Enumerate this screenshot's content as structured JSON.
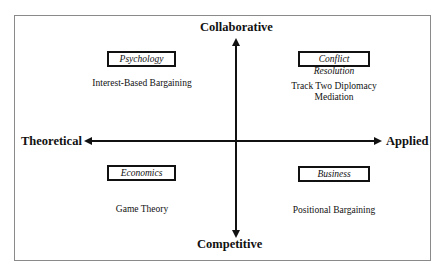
{
  "axes": {
    "top": "Collaborative",
    "bottom": "Competitive",
    "left": "Theoretical",
    "right": "Applied"
  },
  "quadrants": [
    {
      "position": "top-left",
      "discipline": "Psychology",
      "approaches": [
        "Interest-Based Bargaining"
      ]
    },
    {
      "position": "top-right",
      "discipline": "Conflict Resolution",
      "approaches": [
        "Track Two Diplomacy",
        "Mediation"
      ]
    },
    {
      "position": "bottom-left",
      "discipline": "Economics",
      "approaches": [
        "Game Theory"
      ]
    },
    {
      "position": "bottom-right",
      "discipline": "Business",
      "approaches": [
        "Positional Bargaining"
      ]
    }
  ]
}
